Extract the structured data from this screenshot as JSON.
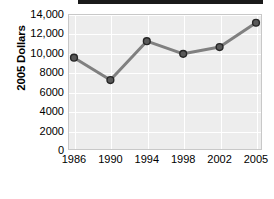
{
  "chart_data": {
    "type": "line",
    "title": "",
    "xlabel": "Year",
    "ylabel": "2005 Dollars",
    "categories": [
      "1986",
      "1990",
      "1994",
      "1998",
      "2002",
      "2005"
    ],
    "x": [
      1986,
      1990,
      1994,
      1998,
      2002,
      2005
    ],
    "values": [
      9500,
      7200,
      11200,
      9900,
      10600,
      13100
    ],
    "series": [
      {
        "name": "2005 Dollars",
        "values": [
          9500,
          7200,
          11200,
          9900,
          10600,
          13100
        ]
      }
    ],
    "ylim": [
      0,
      14000
    ],
    "ytick_values": [
      0,
      2000,
      4000,
      6000,
      8000,
      10000,
      12000,
      14000
    ],
    "ytick_labels": [
      "0",
      "2000",
      "4000",
      "6000",
      "8000",
      "10,000",
      "12,000",
      "14,000"
    ],
    "xtick_labels": [
      "1986",
      "1990",
      "1994",
      "1998",
      "2002",
      "2005"
    ],
    "grid": true,
    "legend": false,
    "legend_position": "none",
    "marker": "circle",
    "annotations": []
  },
  "style": {
    "line_color": "#808080",
    "marker_fill": "#595959",
    "marker_edge": "#262626",
    "plot_background": "#ededed",
    "gridline_color": "#ffffff",
    "plot_border": "#c8c8c8",
    "text_color": "#000000",
    "top_bar_color": "#1a1a1a"
  },
  "axis_titles": {
    "y": "2005 Dollars",
    "x": "Year"
  }
}
